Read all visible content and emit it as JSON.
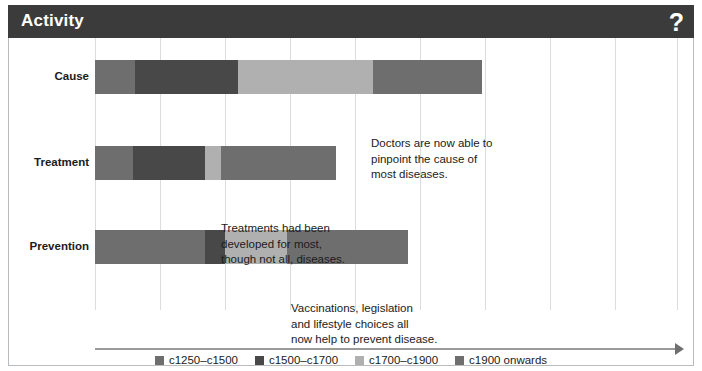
{
  "window": {
    "title": "Activity",
    "help_icon": "?",
    "header_bg": "#3b3b3b",
    "panel_bg": "#ffffff",
    "border_color": "#b9bcbe"
  },
  "chart_data": {
    "type": "bar",
    "orientation": "horizontal",
    "stacked": true,
    "title": "",
    "xlabel": "How much we knew",
    "ylabel": "",
    "grid": true,
    "legend_position": "bottom",
    "categories": [
      "Cause",
      "Treatment",
      "Prevention"
    ],
    "series": [
      {
        "name": "c1250–c1500",
        "color": "#6e6e6e",
        "values": [
          40,
          38,
          110
        ]
      },
      {
        "name": "c1500–c1700",
        "color": "#484848",
        "values": [
          103,
          58,
          20
        ]
      },
      {
        "name": "c1700–c1900",
        "color": "#b0b0b0",
        "values": [
          135,
          16,
          62
        ]
      },
      {
        "name": "c1900 onwards",
        "color": "#6e6e6e",
        "values": [
          109,
          115,
          121
        ]
      }
    ],
    "bars": [
      {
        "category": "Cause",
        "segments": [
          {
            "series": "c1250–c1500",
            "start": 86,
            "end": 126,
            "color": "#6e6e6e"
          },
          {
            "series": "c1500–c1700",
            "start": 126,
            "end": 229,
            "color": "#484848"
          },
          {
            "series": "c1700–c1900",
            "start": 229,
            "end": 364,
            "color": "#b0b0b0"
          },
          {
            "series": "c1900 onwards",
            "start": 364,
            "end": 473,
            "color": "#6e6e6e"
          }
        ]
      },
      {
        "category": "Treatment",
        "segments": [
          {
            "series": "c1250–c1500",
            "start": 86,
            "end": 124,
            "color": "#6e6e6e"
          },
          {
            "series": "c1500–c1700",
            "start": 124,
            "end": 196,
            "color": "#484848"
          },
          {
            "series": "c1700–c1900",
            "start": 196,
            "end": 212,
            "color": "#b0b0b0"
          },
          {
            "series": "c1900 onwards",
            "start": 212,
            "end": 327,
            "color": "#6e6e6e"
          }
        ]
      },
      {
        "category": "Prevention",
        "segments": [
          {
            "series": "c1250–c1500",
            "start": 86,
            "end": 196,
            "color": "#6e6e6e"
          },
          {
            "series": "c1500–c1700",
            "start": 196,
            "end": 216,
            "color": "#484848"
          },
          {
            "series": "c1700–c1900",
            "start": 216,
            "end": 278,
            "color": "#b0b0b0"
          },
          {
            "series": "c1900 onwards",
            "start": 278,
            "end": 399,
            "color": "#6e6e6e"
          }
        ]
      }
    ],
    "annotations": [
      {
        "category": "Cause",
        "text": "Doctors are now able to\npinpoint the cause of\nmost diseases.",
        "x": 362,
        "y": 98
      },
      {
        "category": "Treatment",
        "text": "Treatments had been\ndeveloped for most,\nthough not all, diseases.",
        "x": 212,
        "y": 183
      },
      {
        "category": "Prevention",
        "text": "Vaccinations, legislation\nand lifestyle choices all\nnow help to prevent disease.",
        "x": 282,
        "y": 263
      }
    ],
    "legend": [
      {
        "label": "c1250–c1500",
        "color": "#6e6e6e"
      },
      {
        "label": "c1500–c1700",
        "color": "#484848"
      },
      {
        "label": "c1700–c1900",
        "color": "#b0b0b0"
      },
      {
        "label": "c1900 onwards",
        "color": "#6e6e6e"
      }
    ],
    "gridline_positions": [
      86,
      151,
      216,
      281,
      346,
      411,
      476,
      541,
      606,
      668
    ],
    "bar_rows": [
      {
        "label": "Cause",
        "top": 22,
        "label_top": 32
      },
      {
        "label": "Treatment",
        "top": 108,
        "label_top": 118
      },
      {
        "label": "Prevention",
        "top": 192,
        "label_top": 202
      }
    ]
  }
}
